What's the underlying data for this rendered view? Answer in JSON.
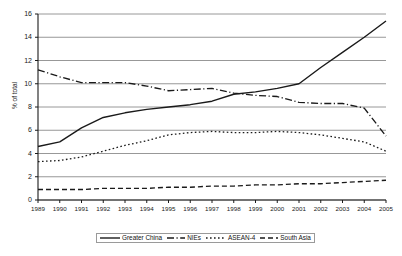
{
  "chart_data": {
    "type": "line",
    "title": "",
    "xlabel": "",
    "ylabel": "% of total",
    "xlim": [
      1989,
      2005
    ],
    "ylim": [
      0,
      16
    ],
    "ytick_step": 2,
    "grid": true,
    "legend_position": "bottom",
    "x": [
      1989,
      1990,
      1991,
      1992,
      1993,
      1994,
      1995,
      1996,
      1997,
      1998,
      1999,
      2000,
      2001,
      2002,
      2003,
      2004,
      2005
    ],
    "categories": [
      "1989",
      "1990",
      "1991",
      "1992",
      "1993",
      "1994",
      "1995",
      "1996",
      "1997",
      "1998",
      "1999",
      "2000",
      "2001",
      "2002",
      "2003",
      "2004",
      "2005"
    ],
    "yticks": [
      "0",
      "2",
      "4",
      "6",
      "8",
      "10",
      "12",
      "14",
      "16"
    ],
    "series": [
      {
        "name": "Greater China",
        "style": "solid",
        "values": [
          4.6,
          5.0,
          6.2,
          7.1,
          7.5,
          7.8,
          8.0,
          8.2,
          8.5,
          9.1,
          9.3,
          9.6,
          10.0,
          11.4,
          12.7,
          14.0,
          15.4
        ]
      },
      {
        "name": "NIEs",
        "style": "dash-dot",
        "values": [
          11.2,
          10.6,
          10.1,
          10.1,
          10.1,
          9.8,
          9.4,
          9.5,
          9.6,
          9.2,
          9.0,
          8.9,
          8.4,
          8.3,
          8.3,
          7.9,
          5.5
        ]
      },
      {
        "name": "ASEAN-4",
        "style": "dotted",
        "values": [
          3.3,
          3.4,
          3.7,
          4.2,
          4.7,
          5.1,
          5.6,
          5.8,
          5.9,
          5.8,
          5.8,
          5.9,
          5.8,
          5.6,
          5.3,
          5.0,
          4.2
        ]
      },
      {
        "name": "South Asia",
        "style": "dashed",
        "values": [
          0.9,
          0.9,
          0.9,
          1.0,
          1.0,
          1.0,
          1.1,
          1.1,
          1.2,
          1.2,
          1.3,
          1.3,
          1.4,
          1.4,
          1.5,
          1.6,
          1.7
        ]
      }
    ]
  },
  "legend": {
    "items": [
      {
        "label": "Greater China"
      },
      {
        "label": "NIEs"
      },
      {
        "label": "ASEAN-4"
      },
      {
        "label": "South Asia"
      }
    ]
  },
  "colors": {
    "line": "#1a1a1a",
    "grid": "#8c8c8c",
    "axis": "#1a1a1a",
    "text": "#202020",
    "background": "#ffffff"
  }
}
